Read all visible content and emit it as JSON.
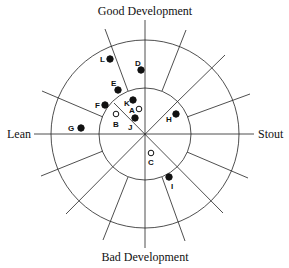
{
  "diagram": {
    "axes": {
      "top": "Good Development",
      "bottom": "Bad Development",
      "left": "Lean",
      "right": "Stout"
    },
    "center": [
      145,
      134
    ],
    "inner_radius": 46,
    "outer_radius": 94,
    "points": [
      {
        "id": "L",
        "x": 110,
        "y": 59,
        "filled": true,
        "lx": 100,
        "ly": 62
      },
      {
        "id": "D",
        "x": 141,
        "y": 70,
        "filled": true,
        "lx": 135,
        "ly": 66
      },
      {
        "id": "E",
        "x": 118,
        "y": 90,
        "filled": true,
        "lx": 111,
        "ly": 86
      },
      {
        "id": "F",
        "x": 105,
        "y": 105,
        "filled": true,
        "lx": 95,
        "ly": 108
      },
      {
        "id": "K",
        "x": 133,
        "y": 100,
        "filled": true,
        "lx": 124,
        "ly": 106
      },
      {
        "id": "A",
        "x": 139,
        "y": 109,
        "filled": false,
        "lx": 129,
        "ly": 113
      },
      {
        "id": "B",
        "x": 116,
        "y": 114,
        "filled": false,
        "lx": 113,
        "ly": 127
      },
      {
        "id": "J",
        "x": 135,
        "y": 118,
        "filled": true,
        "lx": 128,
        "ly": 130
      },
      {
        "id": "G",
        "x": 81,
        "y": 128,
        "filled": true,
        "lx": 68,
        "ly": 131
      },
      {
        "id": "H",
        "x": 176,
        "y": 114,
        "filled": true,
        "lx": 166,
        "ly": 122
      },
      {
        "id": "C",
        "x": 151,
        "y": 153,
        "filled": false,
        "lx": 148,
        "ly": 165
      },
      {
        "id": "I",
        "x": 169,
        "y": 177,
        "filled": true,
        "lx": 171,
        "ly": 189
      }
    ]
  }
}
